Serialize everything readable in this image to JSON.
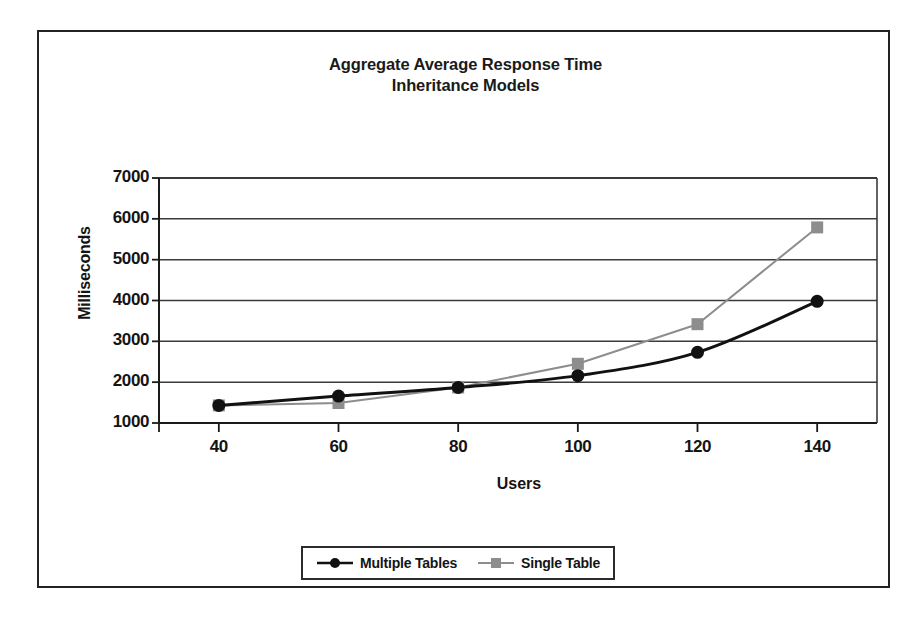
{
  "chart_data": {
    "type": "line",
    "title": "Aggregate Average Response Time",
    "subtitle": "Inheritance Models",
    "xlabel": "Users",
    "ylabel": "Milliseconds",
    "x": [
      40,
      60,
      80,
      100,
      120,
      140
    ],
    "categories": [
      "40",
      "60",
      "80",
      "100",
      "120",
      "140"
    ],
    "xlim": [
      30,
      150
    ],
    "ylim": [
      1000,
      7000
    ],
    "yticks": [
      1000,
      2000,
      3000,
      4000,
      5000,
      6000,
      7000
    ],
    "ytick_labels": [
      "1000",
      "2000",
      "3000",
      "4000",
      "5000",
      "6000",
      "7000"
    ],
    "xticks": [
      40,
      60,
      80,
      100,
      120,
      140
    ],
    "xtick_labels": [
      "40",
      "60",
      "80",
      "100",
      "120",
      "140"
    ],
    "grid": "horizontal",
    "legend_position": "bottom",
    "series": [
      {
        "name": "Multiple Tables",
        "values": [
          1430,
          1660,
          1870,
          2160,
          2730,
          3980
        ],
        "color": "#111111",
        "marker": "circle",
        "line_width": 3,
        "smooth": true
      },
      {
        "name": "Single Table",
        "values": [
          1430,
          1490,
          1870,
          2450,
          3420,
          5790
        ],
        "color": "#8d8d8d",
        "marker": "square",
        "line_width": 2,
        "smooth": false
      }
    ]
  },
  "legend": {
    "items": [
      {
        "label": "Multiple Tables"
      },
      {
        "label": "Single Table"
      }
    ]
  },
  "axis": {
    "y_labels": [
      "7000",
      "6000",
      "5000",
      "4000",
      "3000",
      "2000",
      "1000"
    ],
    "x_labels": [
      "40",
      "60",
      "80",
      "100",
      "120",
      "140"
    ]
  },
  "colors": {
    "frame": "#232323",
    "axis": "#1a1a1a",
    "grid": "#3a3a3a",
    "series_multiple_tables": "#111111",
    "series_single_table": "#8d8d8d",
    "background": "#ffffff"
  }
}
